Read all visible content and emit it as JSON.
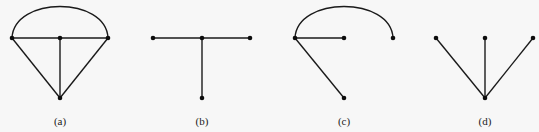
{
  "figure": {
    "panels": [
      {
        "label": "(a)",
        "nodes": [
          {
            "id": "a1",
            "x": 12,
            "y": 38
          },
          {
            "id": "a2",
            "x": 60,
            "y": 38
          },
          {
            "id": "a3",
            "x": 108,
            "y": 38
          },
          {
            "id": "a4",
            "x": 60,
            "y": 98
          }
        ],
        "edges": [
          {
            "from": "a1",
            "to": "a3",
            "type": "line"
          },
          {
            "from": "a2",
            "to": "a4",
            "type": "line"
          },
          {
            "from": "a1",
            "to": "a4",
            "type": "line"
          },
          {
            "from": "a3",
            "to": "a4",
            "type": "line"
          },
          {
            "from": "a1",
            "to": "a3",
            "type": "arc"
          }
        ]
      },
      {
        "label": "(b)",
        "nodes": [
          {
            "id": "b1",
            "x": 153,
            "y": 38
          },
          {
            "id": "b2",
            "x": 202,
            "y": 38
          },
          {
            "id": "b3",
            "x": 250,
            "y": 38
          },
          {
            "id": "b4",
            "x": 202,
            "y": 98
          }
        ],
        "edges": [
          {
            "from": "b1",
            "to": "b3",
            "type": "line"
          },
          {
            "from": "b2",
            "to": "b4",
            "type": "line"
          }
        ]
      },
      {
        "label": "(c)",
        "nodes": [
          {
            "id": "c1",
            "x": 295,
            "y": 38
          },
          {
            "id": "c2",
            "x": 344,
            "y": 38
          },
          {
            "id": "c3",
            "x": 393,
            "y": 38
          },
          {
            "id": "c4",
            "x": 344,
            "y": 98
          }
        ],
        "edges": [
          {
            "from": "c1",
            "to": "c2",
            "type": "line"
          },
          {
            "from": "c1",
            "to": "c4",
            "type": "line"
          },
          {
            "from": "c1",
            "to": "c3",
            "type": "arc"
          }
        ]
      },
      {
        "label": "(d)",
        "nodes": [
          {
            "id": "d1",
            "x": 436,
            "y": 38
          },
          {
            "id": "d2",
            "x": 485,
            "y": 38
          },
          {
            "id": "d3",
            "x": 533,
            "y": 38
          },
          {
            "id": "d4",
            "x": 485,
            "y": 98
          }
        ],
        "edges": [
          {
            "from": "d1",
            "to": "d4",
            "type": "line"
          },
          {
            "from": "d2",
            "to": "d4",
            "type": "line"
          },
          {
            "from": "d3",
            "to": "d4",
            "type": "line"
          }
        ]
      }
    ]
  }
}
